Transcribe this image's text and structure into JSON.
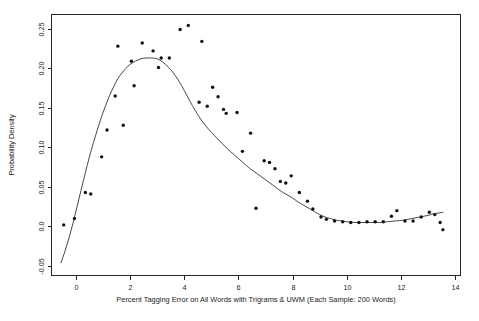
{
  "figure": {
    "title": "",
    "background_color": "#ffffff",
    "point_color": "#111111",
    "curve_color": "#333333",
    "axis_color": "#262626"
  },
  "axes": {
    "x_title": "Percent Tagging Error on All Words with Trigrams & UWM (Each Sample: 200 Words)",
    "y_title": "Probability Density",
    "x_ticks": [
      "0",
      "2",
      "4",
      "6",
      "8",
      "10",
      "12",
      "14"
    ],
    "y_ticks": [
      "-0.05",
      "0.0",
      "0.05",
      "0.10",
      "0.15",
      "0.20",
      "0.25"
    ]
  },
  "chart_data": {
    "type": "scatter",
    "title": "",
    "xlabel": "Percent Tagging Error on All Words with Trigrams & UWM (Each Sample: 200 Words)",
    "ylabel": "Probability Density",
    "xlim": [
      -0.9,
      14.2
    ],
    "ylim": [
      -0.062,
      0.268
    ],
    "xticks": [
      0,
      2,
      4,
      6,
      8,
      10,
      12,
      14
    ],
    "yticks": [
      -0.05,
      0.0,
      0.05,
      0.1,
      0.15,
      0.2,
      0.25
    ],
    "grid": false,
    "legend": null,
    "series": [
      {
        "name": "Observed density estimates",
        "type": "scatter",
        "marker": "filled-circle",
        "color": "#111111",
        "points": [
          [
            -0.45,
            0.002
          ],
          [
            -0.05,
            0.01
          ],
          [
            0.35,
            0.043
          ],
          [
            0.55,
            0.041
          ],
          [
            0.95,
            0.088
          ],
          [
            1.15,
            0.122
          ],
          [
            1.45,
            0.165
          ],
          [
            1.55,
            0.228
          ],
          [
            1.75,
            0.128
          ],
          [
            2.05,
            0.209
          ],
          [
            2.15,
            0.178
          ],
          [
            2.45,
            0.232
          ],
          [
            2.85,
            0.222
          ],
          [
            3.05,
            0.201
          ],
          [
            3.15,
            0.213
          ],
          [
            3.45,
            0.213
          ],
          [
            3.85,
            0.249
          ],
          [
            4.15,
            0.254
          ],
          [
            4.65,
            0.234
          ],
          [
            4.55,
            0.157
          ],
          [
            4.85,
            0.152
          ],
          [
            5.05,
            0.176
          ],
          [
            5.25,
            0.164
          ],
          [
            5.45,
            0.148
          ],
          [
            5.55,
            0.143
          ],
          [
            5.95,
            0.144
          ],
          [
            6.15,
            0.095
          ],
          [
            6.45,
            0.118
          ],
          [
            6.65,
            0.023
          ],
          [
            6.95,
            0.083
          ],
          [
            7.15,
            0.081
          ],
          [
            7.35,
            0.073
          ],
          [
            7.55,
            0.057
          ],
          [
            7.75,
            0.055
          ],
          [
            7.95,
            0.064
          ],
          [
            8.25,
            0.043
          ],
          [
            8.55,
            0.032
          ],
          [
            8.75,
            0.022
          ],
          [
            9.05,
            0.012
          ],
          [
            9.25,
            0.009
          ],
          [
            9.55,
            0.007
          ],
          [
            9.85,
            0.006
          ],
          [
            10.15,
            0.005
          ],
          [
            10.45,
            0.005
          ],
          [
            10.75,
            0.006
          ],
          [
            11.05,
            0.006
          ],
          [
            11.35,
            0.006
          ],
          [
            11.65,
            0.013
          ],
          [
            11.85,
            0.02
          ],
          [
            12.15,
            0.007
          ],
          [
            12.45,
            0.007
          ],
          [
            12.75,
            0.012
          ],
          [
            13.05,
            0.018
          ],
          [
            13.25,
            0.015
          ],
          [
            13.45,
            0.005
          ],
          [
            13.55,
            -0.004
          ]
        ]
      },
      {
        "name": "Fitted density curve",
        "type": "line",
        "color": "#333333",
        "points": [
          [
            -0.55,
            -0.046
          ],
          [
            -0.4,
            -0.031
          ],
          [
            -0.25,
            -0.014
          ],
          [
            -0.1,
            0.005
          ],
          [
            0.05,
            0.026
          ],
          [
            0.2,
            0.047
          ],
          [
            0.35,
            0.068
          ],
          [
            0.5,
            0.088
          ],
          [
            0.65,
            0.106
          ],
          [
            0.8,
            0.123
          ],
          [
            0.95,
            0.139
          ],
          [
            1.1,
            0.153
          ],
          [
            1.25,
            0.166
          ],
          [
            1.4,
            0.177
          ],
          [
            1.55,
            0.187
          ],
          [
            1.7,
            0.194
          ],
          [
            1.85,
            0.2
          ],
          [
            2.0,
            0.205
          ],
          [
            2.2,
            0.209
          ],
          [
            2.4,
            0.212
          ],
          [
            2.6,
            0.213
          ],
          [
            2.8,
            0.213
          ],
          [
            3.0,
            0.212
          ],
          [
            3.2,
            0.208
          ],
          [
            3.4,
            0.202
          ],
          [
            3.6,
            0.194
          ],
          [
            3.8,
            0.184
          ],
          [
            4.0,
            0.172
          ],
          [
            4.2,
            0.159
          ],
          [
            4.4,
            0.147
          ],
          [
            4.6,
            0.136
          ],
          [
            4.8,
            0.127
          ],
          [
            5.0,
            0.119
          ],
          [
            5.2,
            0.112
          ],
          [
            5.4,
            0.105
          ],
          [
            5.6,
            0.098
          ],
          [
            5.8,
            0.092
          ],
          [
            6.0,
            0.086
          ],
          [
            6.2,
            0.08
          ],
          [
            6.4,
            0.074
          ],
          [
            6.6,
            0.069
          ],
          [
            6.8,
            0.064
          ],
          [
            7.0,
            0.059
          ],
          [
            7.2,
            0.054
          ],
          [
            7.4,
            0.049
          ],
          [
            7.6,
            0.044
          ],
          [
            7.8,
            0.04
          ],
          [
            8.0,
            0.036
          ],
          [
            8.2,
            0.031
          ],
          [
            8.4,
            0.027
          ],
          [
            8.6,
            0.023
          ],
          [
            8.8,
            0.019
          ],
          [
            9.0,
            0.015
          ],
          [
            9.2,
            0.012
          ],
          [
            9.4,
            0.01
          ],
          [
            9.6,
            0.008
          ],
          [
            9.8,
            0.007
          ],
          [
            10.0,
            0.006
          ],
          [
            10.3,
            0.005
          ],
          [
            10.6,
            0.005
          ],
          [
            10.9,
            0.005
          ],
          [
            11.2,
            0.005
          ],
          [
            11.5,
            0.006
          ],
          [
            11.8,
            0.007
          ],
          [
            12.1,
            0.008
          ],
          [
            12.4,
            0.01
          ],
          [
            12.7,
            0.012
          ],
          [
            13.0,
            0.014
          ],
          [
            13.2,
            0.016
          ],
          [
            13.4,
            0.017
          ],
          [
            13.55,
            0.018
          ]
        ]
      }
    ]
  }
}
